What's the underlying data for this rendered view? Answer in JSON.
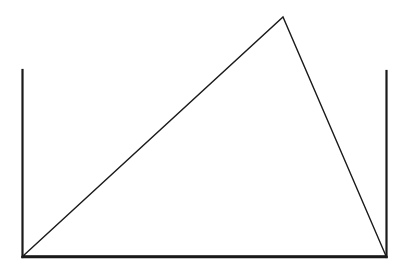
{
  "diagram": {
    "stroke_color": "#1a1a1a",
    "background": "#ffffff",
    "container": {
      "left_wall": {
        "x": 22.5,
        "y_top": 70,
        "y_bottom": 257
      },
      "right_wall": {
        "x": 386.5,
        "y_top": 71,
        "y_bottom": 257
      },
      "base": {
        "y": 257,
        "x_left": 22,
        "x_right": 387
      }
    },
    "triangle": {
      "vertices": [
        [
          23,
          256
        ],
        [
          283,
          17
        ],
        [
          386,
          256
        ]
      ]
    }
  }
}
